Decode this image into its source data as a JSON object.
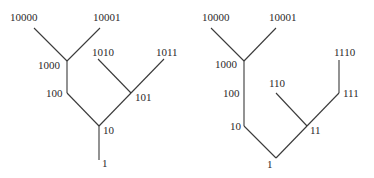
{
  "diagram": {
    "type": "binary-tree-pair",
    "trees": [
      {
        "name": "left-tree",
        "nodes": [
          {
            "id": "1",
            "label": "1",
            "x": 99,
            "y": 160,
            "lx": 102,
            "ly": 167
          },
          {
            "id": "10",
            "label": "10",
            "x": 99,
            "y": 126,
            "lx": 103,
            "ly": 134
          },
          {
            "id": "100",
            "label": "100",
            "x": 67,
            "y": 93,
            "lx": 46,
            "ly": 97
          },
          {
            "id": "101",
            "label": "101",
            "x": 131,
            "y": 93,
            "lx": 135,
            "ly": 101
          },
          {
            "id": "1000",
            "label": "1000",
            "x": 67,
            "y": 61,
            "lx": 38,
            "ly": 69
          },
          {
            "id": "1010",
            "label": "1010",
            "x": 98,
            "y": 59,
            "lx": 92,
            "ly": 56
          },
          {
            "id": "1011",
            "label": "1011",
            "x": 164,
            "y": 59,
            "lx": 156,
            "ly": 56
          },
          {
            "id": "10000",
            "label": "10000",
            "x": 34,
            "y": 28,
            "lx": 10,
            "ly": 21
          },
          {
            "id": "10001",
            "label": "10001",
            "x": 100,
            "y": 28,
            "lx": 93,
            "ly": 21
          }
        ],
        "edges": [
          [
            "1",
            "10"
          ],
          [
            "10",
            "100"
          ],
          [
            "10",
            "101"
          ],
          [
            "100",
            "1000"
          ],
          [
            "1000",
            "10000"
          ],
          [
            "1000",
            "10001"
          ],
          [
            "101",
            "1010"
          ],
          [
            "101",
            "1011"
          ]
        ]
      },
      {
        "name": "right-tree",
        "nodes": [
          {
            "id": "1",
            "label": "1",
            "x": 276,
            "y": 158,
            "lx": 267,
            "ly": 168
          },
          {
            "id": "10",
            "label": "10",
            "x": 244,
            "y": 126,
            "lx": 230,
            "ly": 130
          },
          {
            "id": "100",
            "label": "100",
            "x": 244,
            "y": 93,
            "lx": 223,
            "ly": 97
          },
          {
            "id": "1000",
            "label": "1000",
            "x": 244,
            "y": 61,
            "lx": 215,
            "ly": 68
          },
          {
            "id": "10000",
            "label": "10000",
            "x": 211,
            "y": 28,
            "lx": 202,
            "ly": 21
          },
          {
            "id": "10001",
            "label": "10001",
            "x": 276,
            "y": 28,
            "lx": 269,
            "ly": 21
          },
          {
            "id": "11",
            "label": "11",
            "x": 307,
            "y": 126,
            "lx": 310,
            "ly": 134
          },
          {
            "id": "110",
            "label": "110",
            "x": 276,
            "y": 93,
            "lx": 269,
            "ly": 87
          },
          {
            "id": "111",
            "label": "111",
            "x": 339,
            "y": 93,
            "lx": 343,
            "ly": 97
          },
          {
            "id": "1110",
            "label": "1110",
            "x": 339,
            "y": 60,
            "lx": 334,
            "ly": 56
          }
        ],
        "edges": [
          [
            "1",
            "10"
          ],
          [
            "1",
            "11"
          ],
          [
            "10",
            "100"
          ],
          [
            "100",
            "1000"
          ],
          [
            "1000",
            "10000"
          ],
          [
            "1000",
            "10001"
          ],
          [
            "11",
            "110"
          ],
          [
            "11",
            "111"
          ],
          [
            "111",
            "1110"
          ]
        ]
      }
    ],
    "colors": {
      "edge": "#3a3a3a",
      "text": "#2a2a2a",
      "background": "#ffffff"
    }
  }
}
